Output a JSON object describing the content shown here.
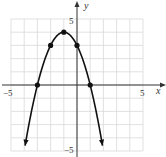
{
  "chart_data": {
    "type": "line",
    "title": "",
    "xlabel": "x",
    "ylabel": "y",
    "xlim": [
      -5,
      5
    ],
    "ylim": [
      -5,
      5
    ],
    "grid": true,
    "tick_labels": {
      "x": [
        "-5",
        "5"
      ],
      "y": [
        "5",
        "-5"
      ]
    },
    "series": [
      {
        "name": "parabola",
        "equation": "y = -(x+1)^2 + 4",
        "marked_points": [
          {
            "x": -3,
            "y": 0
          },
          {
            "x": -2,
            "y": 3
          },
          {
            "x": -1,
            "y": 4
          },
          {
            "x": 0,
            "y": 3
          },
          {
            "x": 1,
            "y": 0
          }
        ],
        "arrows_at_ends": true
      }
    ],
    "colors": {
      "curve": "#111111",
      "grid": "#d9d9d9",
      "axis": "#333333"
    }
  },
  "labels": {
    "x_axis": "x",
    "y_axis": "y",
    "x_min": "−5",
    "x_max": "5",
    "y_max": "5",
    "y_min": "−5"
  }
}
